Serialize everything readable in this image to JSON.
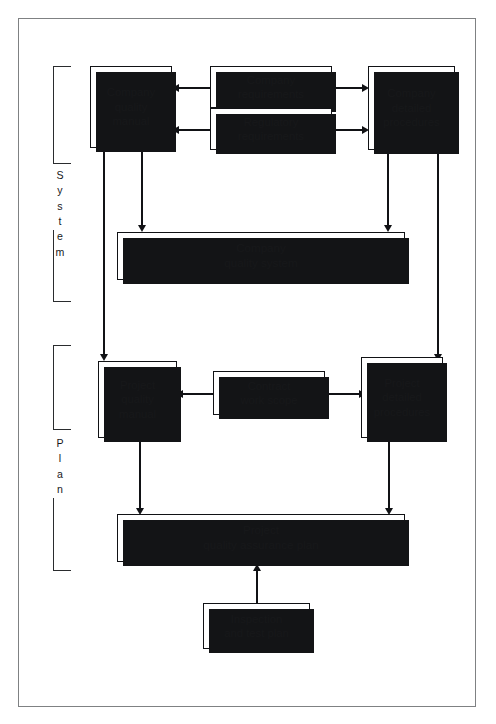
{
  "diagram": {
    "frame_color": "#7f8183",
    "line_color": "#111215",
    "box_fill": "#ffffff",
    "shadow_color": "#131416"
  },
  "brackets": [
    {
      "id": "system",
      "label": "System",
      "letters": [
        "S",
        "y",
        "s",
        "t",
        "e",
        "m"
      ]
    },
    {
      "id": "plan",
      "label": "Plan",
      "letters": [
        "P",
        "l",
        "a",
        "n"
      ]
    }
  ],
  "nodes": [
    {
      "id": "company-quality-manual",
      "text": "Company\nquality\nmanual"
    },
    {
      "id": "company-requirements",
      "text": "Company\nrequirements"
    },
    {
      "id": "regulatory-requirements",
      "text": "Regulatory\nrequirements"
    },
    {
      "id": "company-detailed-procedures",
      "text": "Company\ndetailed\nprocedures"
    },
    {
      "id": "company-quality-system",
      "text": "Company\nquality system"
    },
    {
      "id": "project-quality-manual",
      "text": "Project\nquality\nmanual"
    },
    {
      "id": "contract-work-scope",
      "text": "Contract\nwork scope"
    },
    {
      "id": "project-detailed-procedures",
      "text": "Project\ndetailed\nprocedures"
    },
    {
      "id": "project-qa-plan",
      "text": "Project\nquality assurance plan"
    },
    {
      "id": "inspection-test-plan",
      "text": "Inspection\nand test plan"
    }
  ],
  "edges": [
    {
      "from": "company-requirements",
      "to": "company-quality-manual",
      "direction": "left"
    },
    {
      "from": "regulatory-requirements",
      "to": "company-quality-manual",
      "direction": "left"
    },
    {
      "from": "company-requirements",
      "to": "company-detailed-procedures",
      "direction": "right"
    },
    {
      "from": "regulatory-requirements",
      "to": "company-detailed-procedures",
      "direction": "right"
    },
    {
      "from": "company-quality-manual",
      "to": "company-quality-system",
      "direction": "down"
    },
    {
      "from": "company-detailed-procedures",
      "to": "company-quality-system",
      "direction": "down"
    },
    {
      "from": "company-quality-manual",
      "to": "project-quality-manual",
      "direction": "down"
    },
    {
      "from": "company-detailed-procedures",
      "to": "project-detailed-procedures",
      "direction": "down"
    },
    {
      "from": "contract-work-scope",
      "to": "project-quality-manual",
      "direction": "left"
    },
    {
      "from": "contract-work-scope",
      "to": "project-detailed-procedures",
      "direction": "right"
    },
    {
      "from": "project-quality-manual",
      "to": "project-qa-plan",
      "direction": "down"
    },
    {
      "from": "project-detailed-procedures",
      "to": "project-qa-plan",
      "direction": "down"
    },
    {
      "from": "inspection-test-plan",
      "to": "project-qa-plan",
      "direction": "up"
    }
  ]
}
